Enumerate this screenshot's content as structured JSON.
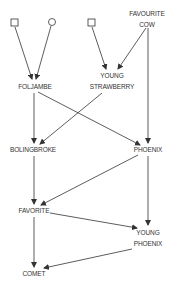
{
  "diagram": {
    "type": "pedigree",
    "nodes": [
      {
        "id": "sire1",
        "shape": "square",
        "label": ""
      },
      {
        "id": "dam1",
        "shape": "circle",
        "label": ""
      },
      {
        "id": "sire2",
        "shape": "square",
        "label": ""
      },
      {
        "id": "favourite_cow",
        "label_line1": "FAVOURITE",
        "label_line2": "COW"
      },
      {
        "id": "foljambe",
        "label": "FOLJAMBE"
      },
      {
        "id": "young_strawberry",
        "label_line1": "YOUNG",
        "label_line2": "STRAWBERRY"
      },
      {
        "id": "bolingbroke",
        "label": "BOLINGBROKE"
      },
      {
        "id": "phoenix",
        "label": "PHOENIX"
      },
      {
        "id": "favorite",
        "label": "FAVORITE"
      },
      {
        "id": "young_phoenix",
        "label_line1": "YOUNG",
        "label_line2": "PHOENIX"
      },
      {
        "id": "comet",
        "label": "COMET"
      }
    ],
    "edges": [
      [
        "sire1",
        "foljambe"
      ],
      [
        "dam1",
        "foljambe"
      ],
      [
        "sire2",
        "young_strawberry"
      ],
      [
        "favourite_cow",
        "young_strawberry"
      ],
      [
        "favourite_cow",
        "phoenix"
      ],
      [
        "foljambe",
        "bolingbroke"
      ],
      [
        "foljambe",
        "phoenix"
      ],
      [
        "young_strawberry",
        "bolingbroke"
      ],
      [
        "bolingbroke",
        "favorite"
      ],
      [
        "phoenix",
        "favorite"
      ],
      [
        "phoenix",
        "young_phoenix"
      ],
      [
        "favorite",
        "young_phoenix"
      ],
      [
        "favorite",
        "comet"
      ],
      [
        "young_phoenix",
        "comet"
      ]
    ],
    "colors": {
      "line": "#333333",
      "text": "#333333",
      "background": "#ffffff"
    }
  }
}
